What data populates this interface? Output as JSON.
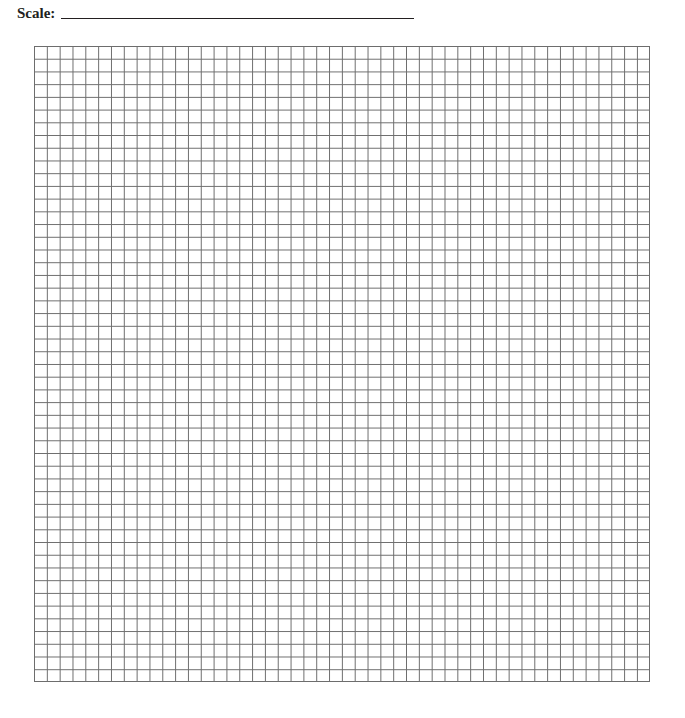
{
  "header": {
    "scale_label": "Scale:",
    "scale_value": ""
  },
  "grid": {
    "columns": 48,
    "rows": 50,
    "line_color": "#6d6d6d"
  }
}
